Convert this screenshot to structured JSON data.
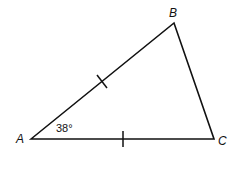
{
  "diagram": {
    "type": "triangle",
    "vertices": {
      "A": {
        "label": "A",
        "x": 31,
        "y": 139
      },
      "B": {
        "label": "B",
        "x": 174,
        "y": 23
      },
      "C": {
        "label": "C",
        "x": 214,
        "y": 139
      }
    },
    "angle_A": "38°",
    "congruent_sides": [
      "AB",
      "AC"
    ],
    "stroke_color": "#111111"
  }
}
